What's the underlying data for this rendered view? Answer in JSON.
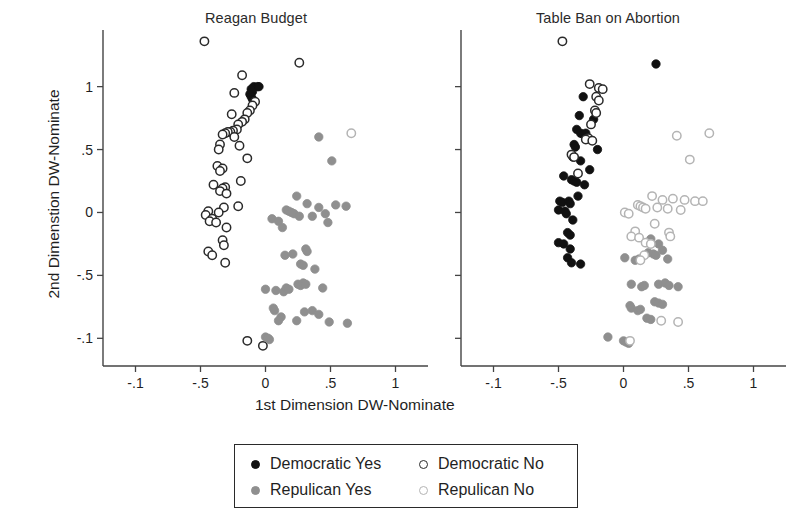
{
  "figure": {
    "xlabel": "1st Dimension DW-Nominate",
    "ylabel": "2nd Dimenstion DW-Nominate"
  },
  "legend": {
    "entries": [
      {
        "label": "Democratic Yes",
        "marker": "filled-black-circle-icon",
        "color": "#111111"
      },
      {
        "label": "Democratic No",
        "marker": "open-black-circle-icon",
        "color": "#2a2a2a"
      },
      {
        "label": "Repulican Yes",
        "marker": "filled-gray-circle-icon",
        "color": "#8f8f8f"
      },
      {
        "label": "Repulican No",
        "marker": "open-gray-circle-icon",
        "color": "#b4b4b4"
      }
    ]
  },
  "chart_data": {
    "type": "scatter",
    "title": "",
    "xlabel": "1st Dimension DW-Nominate",
    "ylabel": "2nd Dimenstion DW-Nominate",
    "xlim": [
      -1.25,
      1.25
    ],
    "ylim": [
      -1.22,
      1.45
    ],
    "xticks": [
      -1,
      -0.5,
      0,
      0.5,
      1
    ],
    "xtick_labels": [
      "-.1",
      "-.5",
      "0",
      ".5",
      "1"
    ],
    "yticks": [
      1,
      0.5,
      0,
      -0.5,
      -1
    ],
    "ytick_labels": [
      "1",
      ".5",
      "0",
      "-.5",
      "-.1"
    ],
    "grid": false,
    "legend_position": "bottom-center",
    "panels": [
      {
        "title": "Reagan Budget",
        "series": [
          {
            "name": "Democratic Yes",
            "marker": "filled",
            "color": "#111111",
            "points": [
              [
                -0.09,
                1.0
              ],
              [
                -0.06,
                1.0
              ],
              [
                -0.05,
                1.0
              ],
              [
                -0.11,
                0.98
              ],
              [
                -0.1,
                0.96
              ],
              [
                -0.12,
                0.94
              ],
              [
                -0.11,
                0.92
              ],
              [
                -0.1,
                0.9
              ]
            ]
          },
          {
            "name": "Democratic No",
            "marker": "open",
            "color": "#2a2a2a",
            "points": [
              [
                -0.47,
                1.36
              ],
              [
                0.26,
                1.19
              ],
              [
                -0.18,
                1.09
              ],
              [
                -0.24,
                0.95
              ],
              [
                -0.08,
                0.88
              ],
              [
                -0.1,
                0.85
              ],
              [
                -0.12,
                0.81
              ],
              [
                -0.14,
                0.79
              ],
              [
                -0.26,
                0.78
              ],
              [
                -0.16,
                0.74
              ],
              [
                -0.18,
                0.72
              ],
              [
                -0.21,
                0.7
              ],
              [
                -0.22,
                0.66
              ],
              [
                -0.25,
                0.65
              ],
              [
                -0.27,
                0.64
              ],
              [
                -0.29,
                0.64
              ],
              [
                -0.31,
                0.63
              ],
              [
                -0.33,
                0.62
              ],
              [
                -0.24,
                0.6
              ],
              [
                -0.35,
                0.54
              ],
              [
                -0.2,
                0.53
              ],
              [
                -0.36,
                0.5
              ],
              [
                -0.14,
                0.43
              ],
              [
                -0.37,
                0.37
              ],
              [
                -0.33,
                0.35
              ],
              [
                -0.35,
                0.33
              ],
              [
                -0.19,
                0.25
              ],
              [
                -0.4,
                0.22
              ],
              [
                -0.31,
                0.2
              ],
              [
                -0.33,
                0.19
              ],
              [
                -0.35,
                0.17
              ],
              [
                -0.3,
                0.15
              ],
              [
                -0.21,
                0.05
              ],
              [
                -0.32,
                0.04
              ],
              [
                -0.44,
                0.01
              ],
              [
                -0.36,
                0.0
              ],
              [
                -0.46,
                -0.02
              ],
              [
                -0.41,
                -0.05
              ],
              [
                -0.43,
                -0.07
              ],
              [
                -0.38,
                -0.08
              ],
              [
                -0.3,
                -0.12
              ],
              [
                -0.33,
                -0.22
              ],
              [
                -0.32,
                -0.26
              ],
              [
                -0.44,
                -0.31
              ],
              [
                -0.41,
                -0.34
              ],
              [
                -0.31,
                -0.4
              ],
              [
                -0.14,
                -1.02
              ],
              [
                -0.02,
                -1.06
              ]
            ]
          },
          {
            "name": "Repulican Yes",
            "marker": "filled",
            "color": "#8f8f8f",
            "points": [
              [
                0.41,
                0.6
              ],
              [
                0.51,
                0.41
              ],
              [
                0.24,
                0.13
              ],
              [
                0.32,
                0.07
              ],
              [
                0.54,
                0.06
              ],
              [
                0.62,
                0.05
              ],
              [
                0.41,
                0.04
              ],
              [
                0.16,
                0.02
              ],
              [
                0.18,
                0.01
              ],
              [
                0.2,
                0.0
              ],
              [
                0.22,
                -0.01
              ],
              [
                0.46,
                -0.01
              ],
              [
                0.26,
                -0.03
              ],
              [
                0.36,
                -0.03
              ],
              [
                0.48,
                -0.08
              ],
              [
                0.05,
                -0.05
              ],
              [
                0.1,
                -0.07
              ],
              [
                0.13,
                -0.12
              ],
              [
                0.15,
                -0.34
              ],
              [
                0.21,
                -0.33
              ],
              [
                0.31,
                -0.29
              ],
              [
                0.32,
                -0.31
              ],
              [
                0.27,
                -0.41
              ],
              [
                0.29,
                -0.42
              ],
              [
                0.38,
                -0.45
              ],
              [
                0.0,
                -0.61
              ],
              [
                0.08,
                -0.62
              ],
              [
                0.14,
                -0.63
              ],
              [
                0.16,
                -0.6
              ],
              [
                0.18,
                -0.61
              ],
              [
                0.25,
                -0.57
              ],
              [
                0.27,
                -0.58
              ],
              [
                0.29,
                -0.56
              ],
              [
                0.31,
                -0.57
              ],
              [
                0.44,
                -0.6
              ],
              [
                0.06,
                -0.76
              ],
              [
                0.07,
                -0.78
              ],
              [
                0.12,
                -0.83
              ],
              [
                0.1,
                -0.86
              ],
              [
                0.24,
                -0.86
              ],
              [
                0.3,
                -0.79
              ],
              [
                0.36,
                -0.78
              ],
              [
                0.41,
                -0.81
              ],
              [
                0.49,
                -0.87
              ],
              [
                0.63,
                -0.88
              ],
              [
                0.0,
                -0.99
              ],
              [
                0.02,
                -1.0
              ],
              [
                0.03,
                -1.01
              ]
            ]
          },
          {
            "name": "Repulican No",
            "marker": "open",
            "color": "#b4b4b4",
            "points": [
              [
                0.66,
                0.63
              ]
            ]
          }
        ]
      },
      {
        "title": "Table Ban on Abortion",
        "series": [
          {
            "name": "Democratic Yes",
            "marker": "filled",
            "color": "#111111",
            "points": [
              [
                0.25,
                1.18
              ],
              [
                -0.31,
                0.92
              ],
              [
                -0.34,
                0.77
              ],
              [
                -0.23,
                0.74
              ],
              [
                -0.36,
                0.66
              ],
              [
                -0.33,
                0.63
              ],
              [
                -0.31,
                0.62
              ],
              [
                -0.29,
                0.63
              ],
              [
                -0.38,
                0.54
              ],
              [
                -0.37,
                0.52
              ],
              [
                -0.2,
                0.5
              ],
              [
                -0.39,
                0.44
              ],
              [
                -0.33,
                0.41
              ],
              [
                -0.26,
                0.34
              ],
              [
                -0.46,
                0.29
              ],
              [
                -0.4,
                0.26
              ],
              [
                -0.38,
                0.25
              ],
              [
                -0.36,
                0.24
              ],
              [
                -0.3,
                0.22
              ],
              [
                -0.35,
                0.13
              ],
              [
                -0.49,
                0.09
              ],
              [
                -0.47,
                0.08
              ],
              [
                -0.42,
                0.09
              ],
              [
                -0.41,
                0.07
              ],
              [
                -0.5,
                0.02
              ],
              [
                -0.45,
                0.01
              ],
              [
                -0.44,
                -0.01
              ],
              [
                -0.39,
                -0.06
              ],
              [
                -0.43,
                -0.16
              ],
              [
                -0.41,
                -0.18
              ],
              [
                -0.5,
                -0.24
              ],
              [
                -0.46,
                -0.25
              ],
              [
                -0.41,
                -0.29
              ],
              [
                -0.43,
                -0.36
              ],
              [
                -0.4,
                -0.4
              ],
              [
                -0.33,
                -0.41
              ]
            ]
          },
          {
            "name": "Democratic No",
            "marker": "open",
            "color": "#2a2a2a",
            "points": [
              [
                -0.47,
                1.36
              ],
              [
                -0.26,
                1.02
              ],
              [
                -0.19,
                0.99
              ],
              [
                -0.16,
                0.98
              ],
              [
                -0.21,
                0.92
              ],
              [
                -0.19,
                0.89
              ],
              [
                -0.22,
                0.81
              ],
              [
                -0.21,
                0.79
              ],
              [
                -0.25,
                0.7
              ],
              [
                -0.27,
                0.59
              ],
              [
                -0.29,
                0.58
              ],
              [
                -0.24,
                0.57
              ],
              [
                -0.4,
                0.46
              ],
              [
                -0.38,
                0.44
              ],
              [
                -0.35,
                0.31
              ]
            ]
          },
          {
            "name": "Repulican Yes",
            "marker": "filled",
            "color": "#8f8f8f",
            "points": [
              [
                0.21,
                -0.21
              ],
              [
                0.27,
                -0.25
              ],
              [
                0.3,
                -0.3
              ],
              [
                0.19,
                -0.32
              ],
              [
                0.23,
                -0.33
              ],
              [
                0.25,
                -0.34
              ],
              [
                0.01,
                -0.36
              ],
              [
                0.09,
                -0.38
              ],
              [
                0.12,
                -0.37
              ],
              [
                0.34,
                -0.37
              ],
              [
                0.06,
                -0.57
              ],
              [
                0.14,
                -0.59
              ],
              [
                0.16,
                -0.58
              ],
              [
                0.27,
                -0.57
              ],
              [
                0.32,
                -0.56
              ],
              [
                0.35,
                -0.58
              ],
              [
                0.42,
                -0.59
              ],
              [
                0.05,
                -0.74
              ],
              [
                0.06,
                -0.76
              ],
              [
                0.11,
                -0.78
              ],
              [
                0.13,
                -0.77
              ],
              [
                0.24,
                -0.71
              ],
              [
                0.27,
                -0.72
              ],
              [
                0.3,
                -0.73
              ],
              [
                0.18,
                -0.84
              ],
              [
                0.21,
                -0.85
              ],
              [
                -0.12,
                -0.99
              ],
              [
                0.0,
                -1.02
              ],
              [
                0.02,
                -1.03
              ],
              [
                0.04,
                -1.04
              ]
            ]
          },
          {
            "name": "Repulican No",
            "marker": "open",
            "color": "#b4b4b4",
            "points": [
              [
                0.41,
                0.61
              ],
              [
                0.66,
                0.63
              ],
              [
                0.51,
                0.42
              ],
              [
                0.22,
                0.13
              ],
              [
                0.3,
                0.1
              ],
              [
                0.38,
                0.11
              ],
              [
                0.47,
                0.1
              ],
              [
                0.55,
                0.09
              ],
              [
                0.61,
                0.09
              ],
              [
                0.11,
                0.06
              ],
              [
                0.13,
                0.05
              ],
              [
                0.15,
                0.04
              ],
              [
                0.17,
                0.03
              ],
              [
                0.26,
                0.04
              ],
              [
                0.34,
                0.03
              ],
              [
                0.44,
                0.02
              ],
              [
                0.01,
                0.0
              ],
              [
                0.04,
                -0.01
              ],
              [
                0.24,
                -0.09
              ],
              [
                0.09,
                -0.15
              ],
              [
                0.06,
                -0.19
              ],
              [
                0.12,
                -0.2
              ],
              [
                0.35,
                -0.16
              ],
              [
                0.36,
                -0.19
              ],
              [
                0.17,
                -0.24
              ],
              [
                0.21,
                -0.25
              ],
              [
                0.16,
                -0.34
              ],
              [
                0.13,
                -0.38
              ],
              [
                0.29,
                -0.86
              ],
              [
                0.42,
                -0.87
              ],
              [
                0.05,
                -1.02
              ]
            ]
          }
        ]
      }
    ]
  }
}
